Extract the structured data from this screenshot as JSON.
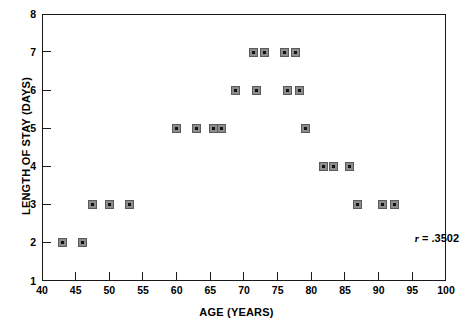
{
  "chart_data": {
    "type": "scatter",
    "title": "",
    "xlabel": "AGE (YEARS)",
    "ylabel": "LENGTH OF STAY (DAYS)",
    "xlim": [
      40,
      100
    ],
    "ylim": [
      1,
      8
    ],
    "xticks": [
      40,
      45,
      50,
      55,
      60,
      65,
      70,
      75,
      80,
      85,
      90,
      95,
      100
    ],
    "yticks": [
      1,
      2,
      3,
      4,
      5,
      6,
      7,
      8
    ],
    "grid": false,
    "legend": null,
    "marker_style": "gray-square-with-center-dot",
    "annotations": [
      {
        "text": "r = .3502",
        "symbol": "r",
        "operator": "=",
        "value": ".3502"
      }
    ],
    "points": [
      {
        "x": 43,
        "y": 2
      },
      {
        "x": 46,
        "y": 2
      },
      {
        "x": 47.5,
        "y": 3
      },
      {
        "x": 50,
        "y": 3
      },
      {
        "x": 53,
        "y": 3
      },
      {
        "x": 60,
        "y": 5
      },
      {
        "x": 63,
        "y": 5
      },
      {
        "x": 65.5,
        "y": 5
      },
      {
        "x": 66.7,
        "y": 5
      },
      {
        "x": 68.7,
        "y": 6
      },
      {
        "x": 71.8,
        "y": 6
      },
      {
        "x": 71.4,
        "y": 7
      },
      {
        "x": 73,
        "y": 7
      },
      {
        "x": 76,
        "y": 7
      },
      {
        "x": 77.6,
        "y": 7
      },
      {
        "x": 76.5,
        "y": 6
      },
      {
        "x": 78.2,
        "y": 6
      },
      {
        "x": 79.1,
        "y": 5
      },
      {
        "x": 81.8,
        "y": 4
      },
      {
        "x": 83.3,
        "y": 4
      },
      {
        "x": 85.6,
        "y": 4
      },
      {
        "x": 86.8,
        "y": 3
      },
      {
        "x": 90.5,
        "y": 3
      },
      {
        "x": 92.3,
        "y": 3
      }
    ]
  },
  "figure": {
    "axis_color": "#1a1a1a",
    "marker_fill": "#8c8c8c",
    "marker_dot": "#111111",
    "background": "#ffffff"
  }
}
